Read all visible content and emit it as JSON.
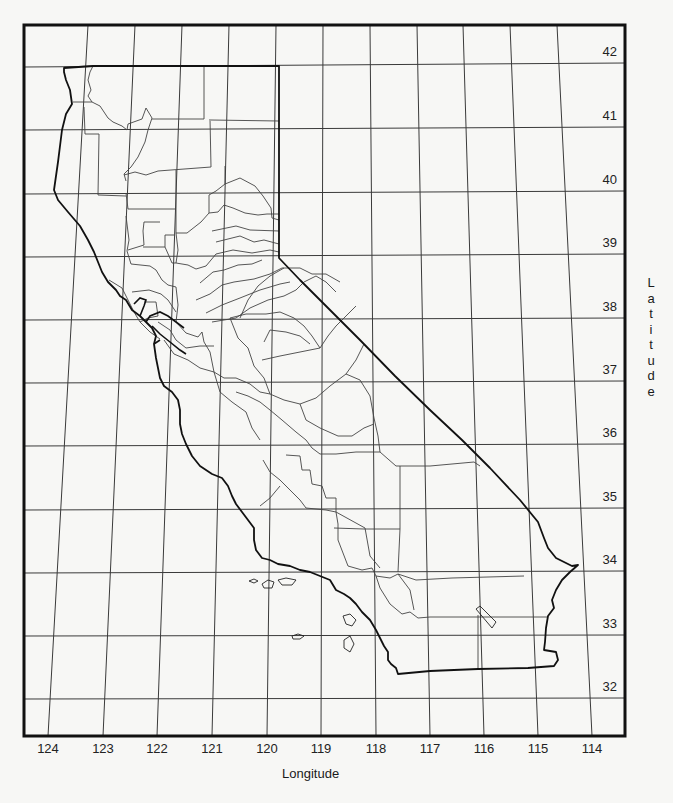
{
  "map": {
    "title": "California counties with latitude/longitude grid",
    "frame": {
      "left": 24,
      "top": 25,
      "right": 625,
      "bottom": 736
    },
    "colors": {
      "background": "#f7f7f5",
      "grid": "#3a3a3a",
      "outline": "#111111",
      "county": "#444444"
    },
    "latitudes": [
      {
        "label": "42",
        "y_left": 67,
        "y_right": 63
      },
      {
        "label": "41",
        "y_left": 130,
        "y_right": 127
      },
      {
        "label": "40",
        "y_left": 194,
        "y_right": 191
      },
      {
        "label": "39",
        "y_left": 257,
        "y_right": 254
      },
      {
        "label": "38",
        "y_left": 320,
        "y_right": 318
      },
      {
        "label": "37",
        "y_left": 383,
        "y_right": 381
      },
      {
        "label": "36",
        "y_left": 446,
        "y_right": 444
      },
      {
        "label": "35",
        "y_left": 510,
        "y_right": 508
      },
      {
        "label": "34",
        "y_left": 573,
        "y_right": 571
      },
      {
        "label": "33",
        "y_left": 636,
        "y_right": 635
      },
      {
        "label": "32",
        "y_left": 699,
        "y_right": 698
      }
    ],
    "longitudes": [
      {
        "label": "124",
        "x_top": 88,
        "x_bottom": 48
      },
      {
        "label": "123",
        "x_top": 135,
        "x_bottom": 103
      },
      {
        "label": "122",
        "x_top": 182,
        "x_bottom": 157
      },
      {
        "label": "121",
        "x_top": 229,
        "x_bottom": 212
      },
      {
        "label": "120",
        "x_top": 276,
        "x_bottom": 267
      },
      {
        "label": "119",
        "x_top": 323,
        "x_bottom": 321
      },
      {
        "label": "118",
        "x_top": 370,
        "x_bottom": 376
      },
      {
        "label": "117",
        "x_top": 417,
        "x_bottom": 430
      },
      {
        "label": "116",
        "x_top": 463,
        "x_bottom": 484
      },
      {
        "label": "115",
        "x_top": 510,
        "x_bottom": 538
      },
      {
        "label": "114",
        "x_top": 557,
        "x_bottom": 592
      }
    ],
    "axis_labels": {
      "x": "Longitude",
      "y": "Latitude"
    }
  }
}
